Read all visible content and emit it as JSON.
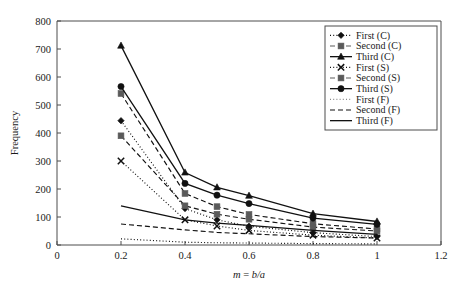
{
  "figure": {
    "background": "#ffffff",
    "ink_color": "#111111",
    "axis_color": "#4d4d4d"
  },
  "chart_data": {
    "type": "line",
    "title": "",
    "xlabel": "m = b/a",
    "xlabel_parts": {
      "variable": "m",
      "equals": " = ",
      "expression": "b/a"
    },
    "ylabel": "Frequency",
    "xlim": [
      0,
      1.2
    ],
    "ylim": [
      0,
      800
    ],
    "xticks": [
      0,
      0.2,
      0.4,
      0.6,
      0.8,
      1,
      1.2
    ],
    "xtick_labels": [
      "0",
      "0.2",
      "0.4",
      "0.6",
      "0.8",
      "1",
      "1.2"
    ],
    "yticks": [
      0,
      100,
      200,
      300,
      400,
      500,
      600,
      700,
      800
    ],
    "ytick_labels": [
      "0",
      "100",
      "200",
      "300",
      "400",
      "500",
      "600",
      "700",
      "800"
    ],
    "grid": false,
    "legend_position": "upper right",
    "x": [
      0.2,
      0.4,
      0.5,
      0.6,
      0.8,
      1.0
    ],
    "series": [
      {
        "name": "First (C)",
        "marker": "diamond",
        "linestyle": "dotted",
        "color": "#111111",
        "values": [
          444,
          130,
          90,
          67,
          44,
          30
        ]
      },
      {
        "name": "Second (C)",
        "marker": "square",
        "linestyle": "dashed",
        "color": "#5a5a5a",
        "values": [
          541,
          184,
          137,
          109,
          76,
          57
        ]
      },
      {
        "name": "Third (C)",
        "marker": "triangle",
        "linestyle": "solid",
        "color": "#111111",
        "values": [
          712,
          259,
          206,
          176,
          112,
          84
        ]
      },
      {
        "name": "First (S)",
        "marker": "cross",
        "linestyle": "dotted",
        "color": "#111111",
        "values": [
          300,
          90,
          68,
          52,
          35,
          25
        ]
      },
      {
        "name": "Second (S)",
        "marker": "square",
        "linestyle": "dashed",
        "color": "#5a5a5a",
        "values": [
          390,
          140,
          110,
          92,
          64,
          50
        ]
      },
      {
        "name": "Third (S)",
        "marker": "circle",
        "linestyle": "solid",
        "color": "#111111",
        "values": [
          566,
          220,
          178,
          148,
          96,
          74
        ]
      },
      {
        "name": "First (F)",
        "marker": "none",
        "linestyle": "dotted",
        "color": "#8a8a8a",
        "values": [
          22,
          10,
          8,
          7,
          5,
          4
        ]
      },
      {
        "name": "Second (F)",
        "marker": "none",
        "linestyle": "dashed",
        "color": "#111111",
        "values": [
          75,
          54,
          45,
          40,
          30,
          25
        ]
      },
      {
        "name": "Third (F)",
        "marker": "none",
        "linestyle": "solid",
        "color": "#111111",
        "values": [
          140,
          90,
          78,
          70,
          52,
          38
        ]
      }
    ]
  }
}
